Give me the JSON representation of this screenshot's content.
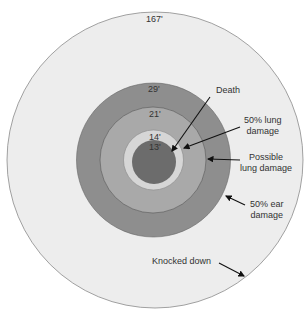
{
  "diagram": {
    "rings": [
      {
        "radius_label": "167'",
        "color": "#ededed"
      },
      {
        "radius_label": "29'",
        "color": "#8e8e8e"
      },
      {
        "radius_label": "21'",
        "color": "#a9a9a9"
      },
      {
        "radius_label": "14'",
        "color": "#d6d6d6"
      },
      {
        "radius_label": "13'",
        "color": "#6c6c6c"
      }
    ],
    "callouts": {
      "death": "Death",
      "lung50_l1": "50% lung",
      "lung50_l2": "damage",
      "possible_l1": "Possible",
      "possible_l2": "lung damage",
      "ear50_l1": "50% ear",
      "ear50_l2": "damage",
      "knocked": "Knocked down"
    }
  }
}
